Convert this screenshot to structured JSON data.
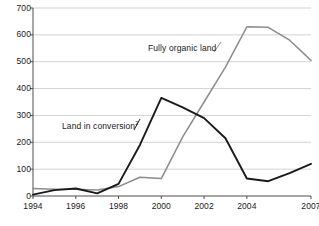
{
  "chart_data": {
    "type": "line",
    "title": "",
    "xlabel": "",
    "ylabel": "",
    "xlim": [
      1994,
      2007
    ],
    "ylim": [
      0,
      700
    ],
    "grid": true,
    "legend_position": "inline-annotation",
    "x": [
      1994,
      1995,
      1996,
      1997,
      1998,
      1999,
      2000,
      2001,
      2002,
      2003,
      2004,
      2005,
      2006,
      2007
    ],
    "xtick_labels": [
      "1994",
      "1996",
      "1998",
      "2000",
      "2002",
      "2004",
      "2007"
    ],
    "xticks": [
      1994,
      1996,
      1998,
      2000,
      2002,
      2004,
      2007
    ],
    "ytick_labels": [
      "0",
      "100",
      "200",
      "300",
      "400",
      "500",
      "600",
      "700"
    ],
    "yticks": [
      0,
      100,
      200,
      300,
      400,
      500,
      600,
      700
    ],
    "series": [
      {
        "name": "Land in conversion",
        "footnote": "2",
        "color": "#1a1a1a",
        "label_text": "Land in conversion",
        "values": [
          5,
          22,
          28,
          10,
          45,
          190,
          365,
          330,
          290,
          215,
          65,
          55,
          85,
          120
        ]
      },
      {
        "name": "Fully organic land",
        "footnote": "",
        "color": "#8c8c8c",
        "label_text": "Fully organic land",
        "values": [
          28,
          25,
          25,
          22,
          35,
          70,
          65,
          220,
          350,
          480,
          630,
          628,
          580,
          505
        ]
      }
    ]
  },
  "annotations": {
    "fully_organic_label": "Fully organic land",
    "land_in_conversion_label": "Land in conversion",
    "land_in_conversion_footnote": "2"
  },
  "colors": {
    "axis": "#4d4d4d",
    "grid": "#c8c8c8",
    "conversion_line": "#1a1a1a",
    "organic_line": "#8c8c8c",
    "background": "#ffffff",
    "text": "#1a1a1a"
  }
}
